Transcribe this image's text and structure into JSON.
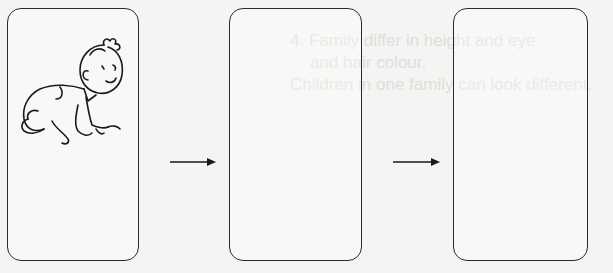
{
  "diagram": {
    "type": "sequence",
    "stages": [
      {
        "index": 1,
        "content": "crawling-baby-illustration"
      },
      {
        "index": 2,
        "content": ""
      },
      {
        "index": 3,
        "content": ""
      }
    ],
    "arrows": 2,
    "colors": {
      "stroke": "#2a2a2a",
      "background": "#f4f4f2"
    }
  },
  "ghost_text": {
    "line1": "a d e : a  u   a  b  ",
    "line2": "4.  Family differ in height and eye",
    "line3": "and hair colour.",
    "line4": "Children in one family can look different."
  }
}
